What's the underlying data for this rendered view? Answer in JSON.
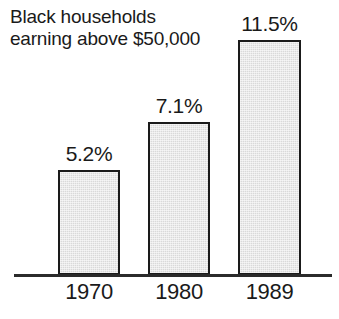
{
  "chart_data": {
    "type": "bar",
    "title": "Black households earning above $50,000",
    "title_lines": [
      "Black households",
      "earning above $50,000"
    ],
    "categories": [
      "1970",
      "1980",
      "1989"
    ],
    "values": [
      5.2,
      7.1,
      11.5
    ],
    "value_labels": [
      "5.2%",
      "7.1%",
      "11.5%"
    ],
    "xlabel": "",
    "ylabel": "",
    "ylim": [
      0,
      13.5
    ],
    "grid": false,
    "legend": null,
    "units": "percent",
    "orientation": "vertical",
    "style": {
      "background_color": "#ffffff",
      "bar_fill_color": "#d9d9d9",
      "bar_border_color": "#1a1a1a",
      "axis_color": "#2b2b2b",
      "text_color": "#1a1a1a"
    },
    "series": [
      {
        "name": "Black households earning above $50,000",
        "values": [
          5.2,
          7.1,
          11.5
        ]
      }
    ]
  }
}
